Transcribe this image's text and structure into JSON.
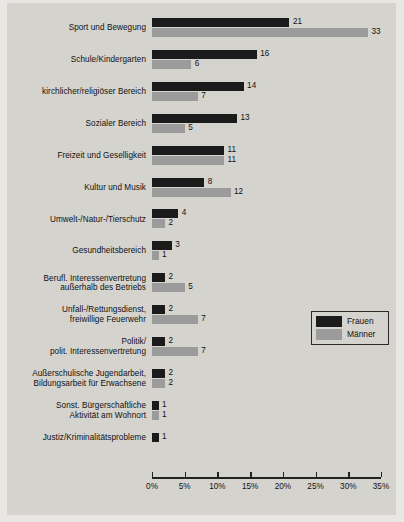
{
  "chart_data": {
    "type": "bar",
    "orientation": "horizontal",
    "title": "",
    "xlabel": "",
    "ylabel": "",
    "xlim": [
      0,
      35
    ],
    "grid": false,
    "legend_position": "middle-right",
    "tick_labels": [
      "0%",
      "5%",
      "10%",
      "15%",
      "20%",
      "25%",
      "30%",
      "35%"
    ],
    "tick_values": [
      0,
      5,
      10,
      15,
      20,
      25,
      30,
      35
    ],
    "categories": [
      "Sport und Bewegung",
      "Schule/Kindergarten",
      "kirchlicher/religiöser Bereich",
      "Sozialer Bereich",
      "Freizeit und Geselligkeit",
      "Kultur und Musik",
      "Umwelt-/Natur-/Tierschutz",
      "Gesundheitsbereich",
      "Berufl. Interessenvertretung außerhalb des Betriebs",
      "Unfall-/Rettungsdienst, freiwillige Feuerwehr",
      "Politik/ polit. Interessenvertretung",
      "Außerschulische Jugendarbeit, Bildungsarbeit für Erwachsene",
      "Sonst. Bürgerschaftliche Aktivität am Wohnort",
      "Justiz/Kriminalitätsprobleme"
    ],
    "category_lines": [
      [
        "Sport und Bewegung"
      ],
      [
        "Schule/Kindergarten"
      ],
      [
        "kirchlicher/religiöser Bereich"
      ],
      [
        "Sozialer Bereich"
      ],
      [
        "Freizeit und Geselligkeit"
      ],
      [
        "Kultur und Musik"
      ],
      [
        "Umwelt-/Natur-/Tierschutz"
      ],
      [
        "Gesundheitsbereich"
      ],
      [
        "Berufl. Interessenvertretung",
        "außerhalb des Betriebs"
      ],
      [
        "Unfall-/Rettungsdienst,",
        "freiwillige Feuerwehr"
      ],
      [
        "Politik/",
        "polit. Interessenvertretung"
      ],
      [
        "Außerschulische Jugendarbeit,",
        "Bildungsarbeit für Erwachsene"
      ],
      [
        "Sonst. Bürgerschaftliche",
        "Aktivität am Wohnort"
      ],
      [
        "Justiz/Kriminalitätsprobleme"
      ]
    ],
    "series": [
      {
        "name": "Frauen",
        "color": "#1b1b1b",
        "values": [
          21,
          16,
          14,
          13,
          11,
          8,
          4,
          3,
          2,
          2,
          2,
          2,
          1,
          1
        ]
      },
      {
        "name": "Männer",
        "color": "#9b9b9b",
        "values": [
          33,
          6,
          7,
          5,
          11,
          12,
          2,
          1,
          5,
          7,
          7,
          2,
          1,
          null
        ]
      }
    ]
  },
  "legend": {
    "entries": [
      {
        "label": "Frauen",
        "color": "#1b1b1b"
      },
      {
        "label": "Männer",
        "color": "#9b9b9b"
      }
    ]
  },
  "colors": {
    "background": "#d5d3ce",
    "page": "#e8e7e3",
    "axis": "#222222",
    "frauen": "#1b1b1b",
    "maenner": "#9b9b9b"
  }
}
